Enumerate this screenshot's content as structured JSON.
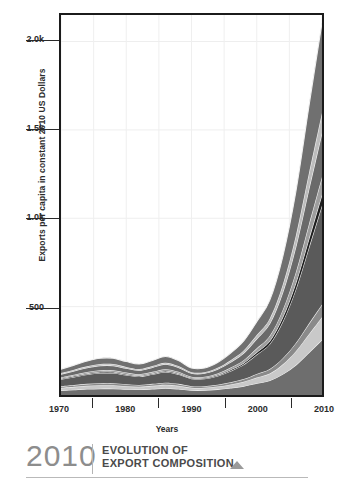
{
  "footer": {
    "year": "2010",
    "title_line1": "EVOLUTION OF",
    "title_line2": "EXPORT COMPOSITION",
    "arrow": "up-triangle-icon"
  },
  "chart_data": {
    "type": "area",
    "title": "EVOLUTION OF EXPORT COMPOSITION",
    "subtitle": "2010",
    "xlabel": "Years",
    "ylabel": "Exports per capita in constant 2010 US Dollars",
    "grid": true,
    "legend_position": "none",
    "stacked": true,
    "xlim": [
      1970,
      2010
    ],
    "ylim": [
      0,
      2150
    ],
    "xticks": [
      1970,
      1980,
      1990,
      2000,
      2010
    ],
    "xticklabels": [
      "1970",
      "1980",
      "1990",
      "2000",
      "2010"
    ],
    "xminorticks": [
      1975,
      1985,
      1995,
      2005
    ],
    "yticks": [
      500,
      1000,
      1500,
      2000
    ],
    "yticklabels": [
      "500",
      "1.0k",
      "1.5k",
      "2.0k"
    ],
    "x": [
      1970,
      1972,
      1974,
      1976,
      1978,
      1980,
      1982,
      1984,
      1986,
      1988,
      1990,
      1992,
      1994,
      1996,
      1998,
      2000,
      2002,
      2004,
      2006,
      2008,
      2010
    ],
    "series": [
      {
        "name": "band-1",
        "color": "#6e6e6e",
        "values": [
          26,
          30,
          34,
          36,
          36,
          33,
          31,
          34,
          38,
          34,
          27,
          27,
          32,
          40,
          50,
          66,
          82,
          118,
          170,
          240,
          312
        ]
      },
      {
        "name": "band-2",
        "color": "#c9c9c9",
        "values": [
          14,
          16,
          18,
          19,
          19,
          17,
          16,
          18,
          20,
          18,
          14,
          14,
          16,
          20,
          25,
          33,
          40,
          56,
          78,
          104,
          128
        ]
      },
      {
        "name": "band-3",
        "color": "#8a8a8a",
        "values": [
          9,
          10,
          11,
          12,
          12,
          11,
          10,
          11,
          12,
          11,
          9,
          9,
          10,
          12,
          15,
          20,
          25,
          34,
          46,
          60,
          72
        ]
      },
      {
        "name": "band-4",
        "color": "#5a5a5a",
        "values": [
          40,
          46,
          53,
          57,
          57,
          52,
          48,
          54,
          60,
          54,
          42,
          42,
          50,
          64,
          82,
          110,
          142,
          208,
          305,
          430,
          560
        ]
      },
      {
        "name": "band-5",
        "color": "#1f1f1f",
        "values": [
          4,
          5,
          5,
          6,
          6,
          5,
          5,
          5,
          6,
          5,
          4,
          4,
          5,
          7,
          9,
          13,
          17,
          25,
          36,
          50,
          62
        ]
      },
      {
        "name": "band-6",
        "color": "#9e9e9e",
        "values": [
          7,
          8,
          9,
          10,
          10,
          9,
          8,
          9,
          10,
          9,
          7,
          7,
          9,
          12,
          16,
          22,
          29,
          42,
          60,
          82,
          100
        ]
      },
      {
        "name": "band-7",
        "color": "#6a6a6a",
        "values": [
          18,
          21,
          24,
          26,
          26,
          24,
          22,
          25,
          28,
          25,
          20,
          20,
          24,
          31,
          40,
          54,
          70,
          100,
          145,
          200,
          250
        ]
      },
      {
        "name": "band-8",
        "color": "#bdbdbd",
        "values": [
          6,
          7,
          8,
          9,
          9,
          8,
          7,
          8,
          9,
          8,
          6,
          6,
          8,
          11,
          15,
          21,
          28,
          42,
          62,
          88,
          112
        ]
      },
      {
        "name": "band-9",
        "color": "#707070",
        "values": [
          22,
          26,
          30,
          33,
          33,
          30,
          28,
          31,
          35,
          31,
          24,
          24,
          30,
          40,
          54,
          76,
          104,
          160,
          250,
          380,
          510
        ]
      }
    ]
  }
}
